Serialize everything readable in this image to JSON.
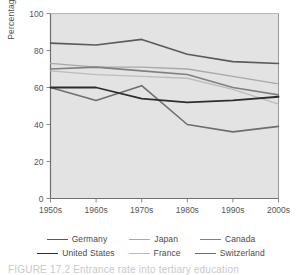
{
  "chart_data": {
    "type": "line",
    "title": "",
    "xlabel": "",
    "ylabel": "Percentage",
    "categories": [
      "1950s",
      "1960s",
      "1970s",
      "1980s",
      "1990s",
      "2000s"
    ],
    "ylim": [
      0,
      100
    ],
    "yticks": [
      0,
      20,
      40,
      60,
      80,
      100
    ],
    "grid": false,
    "legend_position": "bottom",
    "plot_background": "#e3e3e3",
    "series": [
      {
        "name": "Germany",
        "values": [
          84,
          83,
          86,
          78,
          74,
          73
        ],
        "color": "#5a5a5a"
      },
      {
        "name": "Japan",
        "values": [
          73,
          71,
          71,
          70,
          66,
          62
        ],
        "color": "#a8a8a8"
      },
      {
        "name": "Canada",
        "values": [
          70,
          71,
          69,
          67,
          60,
          56
        ],
        "color": "#808080"
      },
      {
        "name": "United States",
        "values": [
          60,
          60,
          54,
          52,
          53,
          55
        ],
        "color": "#2e2e2e"
      },
      {
        "name": "France",
        "values": [
          69,
          67,
          66,
          65,
          59,
          51
        ],
        "color": "#bcbcbc"
      },
      {
        "name": "Switzerland",
        "values": [
          60,
          53,
          61,
          40,
          36,
          39
        ],
        "color": "#6e6e6e"
      }
    ]
  },
  "axes": {
    "y_label": "Percentage",
    "y_ticks": [
      "100",
      "80",
      "60",
      "40",
      "20",
      "0"
    ],
    "x_ticks": [
      "1950s",
      "1960s",
      "1970s",
      "1980s",
      "1990s",
      "2000s"
    ]
  },
  "legend": {
    "row1": [
      {
        "label": "Germany",
        "color": "#5a5a5a",
        "width": 1.6
      },
      {
        "label": "Japan",
        "color": "#a8a8a8",
        "width": 1.3
      },
      {
        "label": "Canada",
        "color": "#808080",
        "width": 1.5
      }
    ],
    "row2": [
      {
        "label": "United States",
        "color": "#2e2e2e",
        "width": 1.8
      },
      {
        "label": "France",
        "color": "#bcbcbc",
        "width": 1.3
      },
      {
        "label": "Switzerland",
        "color": "#6e6e6e",
        "width": 1.6
      }
    ]
  },
  "caption": {
    "text": "FIGURE 17.2  Entrance rate into tertiary education"
  }
}
